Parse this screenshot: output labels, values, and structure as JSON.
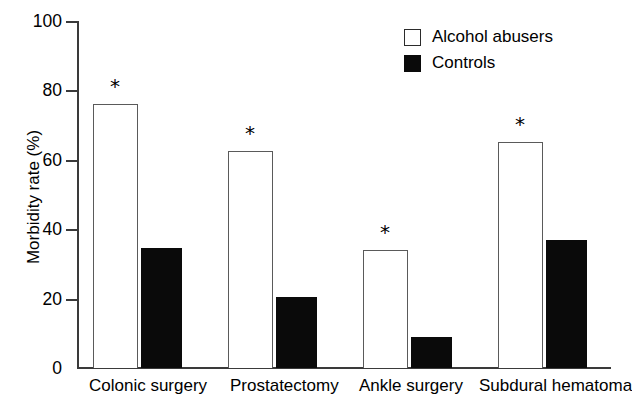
{
  "chart_data": {
    "type": "bar",
    "title": "",
    "xlabel": "",
    "ylabel": "Morbidity rate  (%)",
    "ylim": [
      0,
      100
    ],
    "ytick_labels": [
      "100",
      "80",
      "60",
      "40",
      "20",
      "0"
    ],
    "ytick_values": [
      100,
      80,
      60,
      40,
      20,
      0
    ],
    "grid": false,
    "legend_position": "top-right",
    "categories": [
      "Colonic surgery",
      "Prostatectomy",
      "Ankle surgery",
      "Subdural hematoma"
    ],
    "series": [
      {
        "name": "Alcohol abusers",
        "style": "open",
        "color": "#ffffff",
        "edge_color": "#5a5a5a",
        "values": [
          76,
          62.5,
          34,
          65
        ]
      },
      {
        "name": "Controls",
        "style": "filled",
        "color": "#0a0a0a",
        "edge_color": "#0a0a0a",
        "values": [
          34.5,
          20.5,
          9,
          37
        ]
      }
    ],
    "annotations": [
      {
        "symbol": "*",
        "category": "Colonic surgery",
        "series": "Alcohol abusers"
      },
      {
        "symbol": "*",
        "category": "Prostatectomy",
        "series": "Alcohol abusers"
      },
      {
        "symbol": "*",
        "category": "Ankle surgery",
        "series": "Alcohol abusers"
      },
      {
        "symbol": "*",
        "category": "Subdural hematoma",
        "series": "Alcohol abusers"
      }
    ]
  },
  "axis": {
    "y_title": "Morbidity rate  (%)",
    "ticks": [
      {
        "label": "100",
        "value": 100
      },
      {
        "label": "80",
        "value": 80
      },
      {
        "label": "60",
        "value": 60
      },
      {
        "label": "40",
        "value": 40
      },
      {
        "label": "20",
        "value": 20
      },
      {
        "label": "0",
        "value": 0
      }
    ]
  },
  "legend": {
    "items": [
      {
        "label": "Alcohol abusers",
        "style": "open"
      },
      {
        "label": "Controls",
        "style": "filled"
      }
    ]
  },
  "categories": [
    {
      "label": "Colonic surgery"
    },
    {
      "label": "Prostatectomy"
    },
    {
      "label": "Ankle surgery"
    },
    {
      "label": "Subdural hematoma"
    }
  ],
  "annotation_symbol": "*"
}
